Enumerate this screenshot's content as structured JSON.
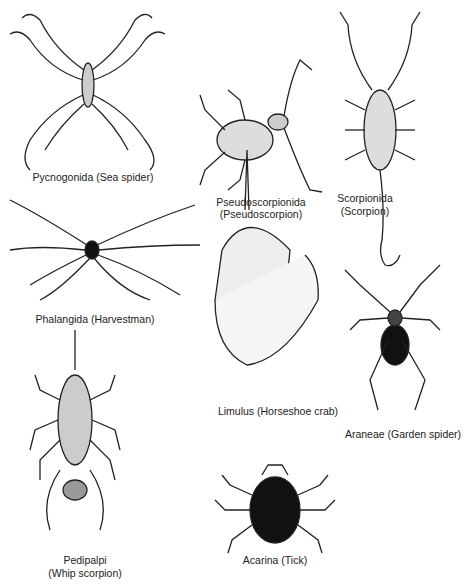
{
  "figures": [
    {
      "id": "pycnogonida",
      "label": "Pycnogonida (Sea spider)"
    },
    {
      "id": "pseudoscorpionida",
      "label_line1": "Pseudoscorpionida",
      "label_line2": "(Pseudoscorpion)"
    },
    {
      "id": "scorpionida",
      "label_line1": "Scorpionida",
      "label_line2": "(Scorpion)"
    },
    {
      "id": "phalangida",
      "label": "Phalangida (Harvestman)"
    },
    {
      "id": "limulus",
      "label": "Limulus (Horseshoe crab)"
    },
    {
      "id": "araneae",
      "label": "Araneae (Garden spider)"
    },
    {
      "id": "pedipalpi",
      "label_line1": "Pedipalpi",
      "label_line2": "(Whip scorpion)"
    },
    {
      "id": "acarina",
      "label": "Acarina (Tick)"
    }
  ]
}
